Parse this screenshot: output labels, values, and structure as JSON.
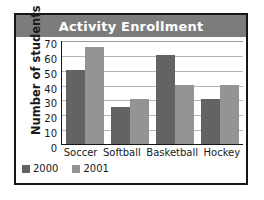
{
  "chart_data": {
    "type": "bar",
    "title": "Activity Enrollment",
    "xlabel": "",
    "ylabel": "Number of students",
    "categories": [
      "Soccer",
      "Softball",
      "Basketball",
      "Hockey"
    ],
    "series": [
      {
        "name": "2000",
        "color": "#636363",
        "values": [
          50,
          25,
          60,
          30
        ]
      },
      {
        "name": "2001",
        "color": "#949494",
        "values": [
          65,
          30,
          40,
          40
        ]
      }
    ],
    "ylim": [
      0,
      70
    ],
    "yticks": [
      70,
      60,
      50,
      40,
      30,
      20,
      10,
      0
    ],
    "grid": true,
    "legend_position": "bottom-left"
  },
  "style": {
    "title_banner_color": "#7c7c7c",
    "title_text_color": "#ffffff",
    "border_color": "#151515",
    "gridline_color": "#b4b4b4",
    "background": "#ffffff"
  }
}
